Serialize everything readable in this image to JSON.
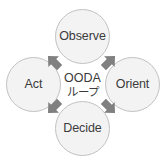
{
  "diagram": {
    "center": {
      "line1": "OODA",
      "line2": "ループ"
    },
    "colors": {
      "background": "#ffffff",
      "node_fill": "#f3f3f3",
      "node_border": "#c2c2c2",
      "text": "#3b3b3b",
      "arrow": "#808080"
    },
    "nodes": [
      {
        "id": "observe",
        "label": "Observe",
        "position": "top"
      },
      {
        "id": "orient",
        "label": "Orient",
        "position": "right"
      },
      {
        "id": "decide",
        "label": "Decide",
        "position": "bottom"
      },
      {
        "id": "act",
        "label": "Act",
        "position": "left"
      }
    ],
    "arrows": [
      {
        "id": "act-to-observe",
        "from": "act",
        "to": "observe",
        "icon": "block-arrow-icon",
        "direction": "up-right"
      },
      {
        "id": "observe-to-orient",
        "from": "observe",
        "to": "orient",
        "icon": "block-arrow-icon",
        "direction": "down-right"
      },
      {
        "id": "orient-to-decide",
        "from": "orient",
        "to": "decide",
        "icon": "block-arrow-icon",
        "direction": "down-left"
      },
      {
        "id": "decide-to-act",
        "from": "decide",
        "to": "act",
        "icon": "block-arrow-icon",
        "direction": "up-left"
      }
    ]
  }
}
